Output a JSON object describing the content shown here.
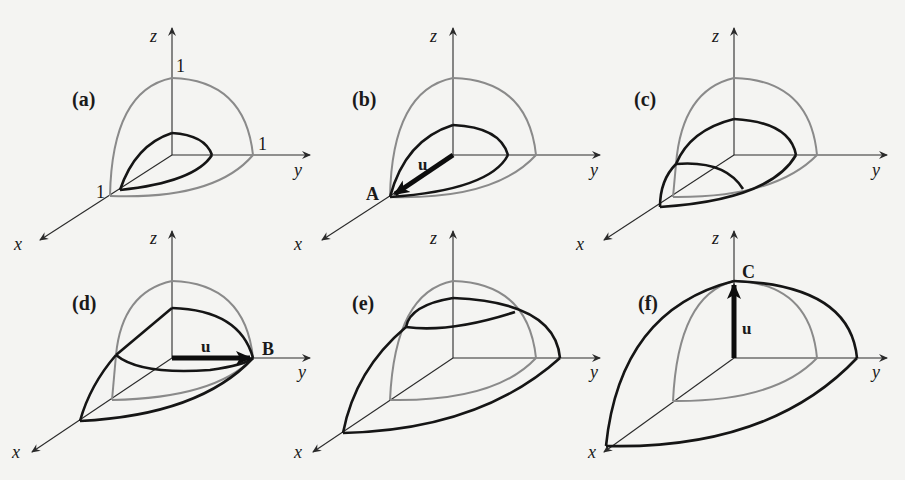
{
  "figure": {
    "colors": {
      "background": "#f4f4f2",
      "sphere_octant": "#8a8a8a",
      "ellipsoid": "#151515",
      "vector": "#0d0d0d"
    },
    "axis_labels": {
      "x": "x",
      "y": "y",
      "z": "z"
    },
    "panels": [
      {
        "id": "a",
        "label": "(a)",
        "tick_labels": {
          "x": "1",
          "y": "1",
          "z": "1"
        }
      },
      {
        "id": "b",
        "label": "(b)",
        "vector_label": "u",
        "point_label": "A",
        "vector_direction": "x"
      },
      {
        "id": "c",
        "label": "(c)"
      },
      {
        "id": "d",
        "label": "(d)",
        "vector_label": "u",
        "point_label": "B",
        "vector_direction": "y"
      },
      {
        "id": "e",
        "label": "(e)"
      },
      {
        "id": "f",
        "label": "(f)",
        "vector_label": "u",
        "point_label": "C",
        "vector_direction": "z"
      }
    ]
  }
}
